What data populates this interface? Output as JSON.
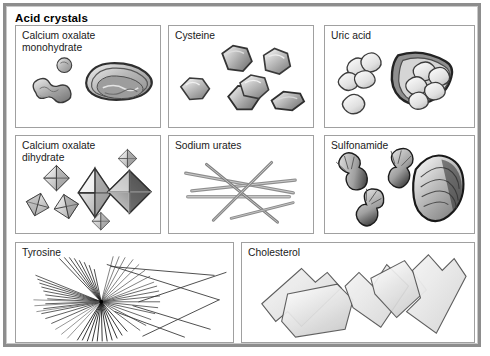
{
  "figure": {
    "title": "Acid crystals",
    "frame_color": "#8d8d8d",
    "panel_border_color": "#a0a0a0",
    "background": "#ffffff",
    "panel_count": 8,
    "row_layout": [
      3,
      3,
      2
    ]
  },
  "panels": [
    {
      "id": "calcium-oxalate-monohydrate",
      "label": "Calcium oxalate\nmonohydrate",
      "row": 1,
      "col": 1,
      "crystal_form": "dumbbell and oval envelope shapes",
      "shade": "#9a9a9a"
    },
    {
      "id": "cysteine",
      "label": "Cysteine",
      "row": 1,
      "col": 2,
      "crystal_form": "hexagonal plates",
      "shade": "#a8a8a8"
    },
    {
      "id": "uric-acid",
      "label": "Uric acid",
      "row": 1,
      "col": 3,
      "crystal_form": "rhomboid plates and clustered rosettes",
      "shade": "#d8d8d8"
    },
    {
      "id": "calcium-oxalate-dihydrate",
      "label": "Calcium oxalate\ndihydrate",
      "row": 2,
      "col": 1,
      "crystal_form": "octahedral envelope bipyramids",
      "shade": "#b4b4b4"
    },
    {
      "id": "sodium-urates",
      "label": "Sodium urates",
      "row": 2,
      "col": 2,
      "crystal_form": "slender crossing needles",
      "shade": "#8e8e8e"
    },
    {
      "id": "sulfonamide",
      "label": "Sulfonamide",
      "row": 2,
      "col": 3,
      "crystal_form": "dark sheaves and shocks of wheat",
      "shade": "#4a4a4a"
    },
    {
      "id": "tyrosine",
      "label": "Tyrosine",
      "row": 3,
      "col": 1,
      "crystal_form": "fine radiating needle sheaves",
      "shade": "#2e2e2e"
    },
    {
      "id": "cholesterol",
      "label": "Cholesterol",
      "row": 3,
      "col": 2,
      "crystal_form": "flat rectangular plates with notched corners",
      "shade": "#e2e2e2"
    }
  ]
}
